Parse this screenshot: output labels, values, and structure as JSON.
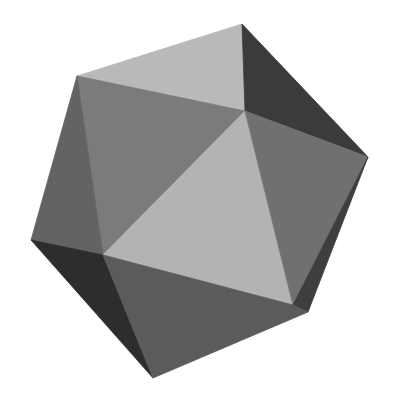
{
  "figure": {
    "background": "#ffffff",
    "vertices": {
      "A": [
        242,
        24
      ],
      "B": [
        77,
        76
      ],
      "C": [
        245,
        111
      ],
      "D": [
        368,
        157
      ],
      "E": [
        31,
        240
      ],
      "F": [
        103,
        255
      ],
      "G": [
        293,
        305
      ],
      "H": [
        308,
        312
      ],
      "I": [
        153,
        378
      ]
    },
    "faces": [
      {
        "name": "face-top",
        "points": "242,24 77,76 245,111",
        "fill": "#b9b9b9"
      },
      {
        "name": "face-top-right",
        "points": "242,24 245,111 368,157",
        "fill": "#3b3b3b"
      },
      {
        "name": "face-upper-left",
        "points": "77,76 245,111 103,255",
        "fill": "#7b7b7b"
      },
      {
        "name": "face-left",
        "points": "77,76 103,255 31,240",
        "fill": "#636363"
      },
      {
        "name": "face-center",
        "points": "245,111 103,255 293,305",
        "fill": "#b3b3b3"
      },
      {
        "name": "face-right",
        "points": "245,111 368,157 293,305",
        "fill": "#707070"
      },
      {
        "name": "face-right-edge",
        "points": "368,157 293,305 308,312",
        "fill": "#3e3e3e"
      },
      {
        "name": "face-lower-left",
        "points": "31,240 103,255 153,378",
        "fill": "#2d2d2d"
      },
      {
        "name": "face-bottom",
        "points": "103,255 293,305 308,312 153,378",
        "fill": "#5b5b5b"
      }
    ]
  }
}
